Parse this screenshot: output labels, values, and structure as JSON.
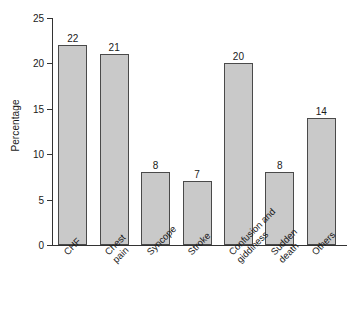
{
  "chart_data": {
    "type": "bar",
    "title": "",
    "xlabel": "",
    "ylabel": "Percentage",
    "ylim": [
      0,
      25
    ],
    "yticks": [
      0,
      5,
      10,
      15,
      20,
      25
    ],
    "ytick_labels": [
      "0",
      "5",
      "10",
      "15",
      "20",
      "25"
    ],
    "grid": false,
    "legend": false,
    "bar_fill_color": "#c9c9c9",
    "bar_edge_color": "#4a4a4a",
    "background_color": "#ffffff",
    "value_labels_shown": true,
    "categories": [
      "CHF",
      "Chest pain",
      "Syncope",
      "Stroke",
      "Confusion and giddiness",
      "Sudden death",
      "Others"
    ],
    "category_label_lines": [
      [
        "CHF"
      ],
      [
        "Chest",
        "pain"
      ],
      [
        "Syncope"
      ],
      [
        "Stroke"
      ],
      [
        "Confusion and",
        "giddiness"
      ],
      [
        "Sudden",
        "death"
      ],
      [
        "Others"
      ]
    ],
    "values": [
      22,
      21,
      8,
      7,
      20,
      8,
      14
    ],
    "value_label_texts": [
      "22",
      "21",
      "8",
      "7",
      "20",
      "8",
      "14"
    ]
  }
}
